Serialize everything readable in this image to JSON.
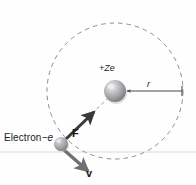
{
  "figure": {
    "background_color": "#fefefe"
  },
  "labels": {
    "electron_name": "Electron",
    "electron_charge": "−e",
    "nucleus_charge": "+Ze",
    "force_vector": "F",
    "velocity_vector": "v",
    "radius": "r"
  },
  "colors": {
    "orbit_dash": "#8c8c96",
    "nucleus_fill": "#9a9a9e",
    "nucleus_highlight": "#e6e6e8",
    "electron_fill": "#a0a0a4",
    "electron_highlight": "#dcdcdf",
    "arrow_dark": "#3a3a3a",
    "arrow_gray": "#6f6f74",
    "radius_line": "#4a4a4a",
    "baseline": "#e2e2e4",
    "text": "#1a1a1a"
  },
  "geometry": {
    "orbit_center_x": 115,
    "orbit_center_y": 91,
    "orbit_radius": 68,
    "nucleus_x": 115,
    "nucleus_y": 91,
    "nucleus_radius": 11,
    "electron_x": 61,
    "electron_y": 144,
    "electron_radius": 7,
    "radius_arrow_start_x": 126,
    "radius_arrow_end_x": 183,
    "radius_arrow_y": 91
  }
}
